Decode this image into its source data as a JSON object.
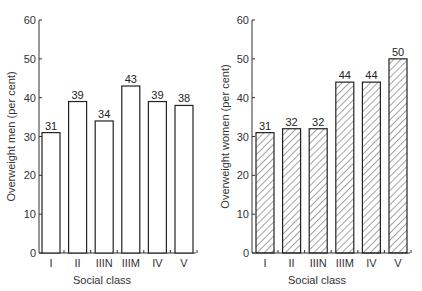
{
  "chart_data": [
    {
      "type": "bar",
      "title": "",
      "xlabel": "Social class",
      "ylabel": "Overweight men (per cent)",
      "categories": [
        "I",
        "II",
        "IIIN",
        "IIIM",
        "IV",
        "V"
      ],
      "values": [
        31,
        39,
        34,
        43,
        39,
        38
      ],
      "data_labels": [
        "31",
        "39",
        "34",
        "43",
        "39",
        "38"
      ],
      "ylim": [
        0,
        60
      ],
      "yticks": [
        0,
        10,
        20,
        30,
        40,
        50,
        60
      ],
      "grid": false,
      "fill": "none",
      "legend": null
    },
    {
      "type": "bar",
      "title": "",
      "xlabel": "Social class",
      "ylabel": "Overweight women (per cent)",
      "categories": [
        "I",
        "II",
        "IIIN",
        "IIIM",
        "IV",
        "V"
      ],
      "values": [
        31,
        32,
        32,
        44,
        44,
        50
      ],
      "data_labels": [
        "31",
        "32",
        "32",
        "44",
        "44",
        "50"
      ],
      "ylim": [
        0,
        60
      ],
      "yticks": [
        0,
        10,
        20,
        30,
        40,
        50,
        60
      ],
      "grid": false,
      "fill": "hatched",
      "legend": null
    }
  ]
}
